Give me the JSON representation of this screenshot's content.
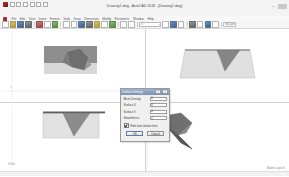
{
  "window": {
    "title": "Drawing1.dwg - AutoCAD 2018 - [Drawing1.dwg]",
    "minimize": "—",
    "maximize": "❐",
    "close": "✕"
  },
  "menubar": {
    "items": [
      "File",
      "Edit",
      "View",
      "Insert",
      "Format",
      "Tools",
      "Draw",
      "Dimension",
      "Modify",
      "Parametric",
      "Window",
      "Help"
    ]
  },
  "toolbar": {
    "layer_combo": "0",
    "color_combo": "ByLayer",
    "linetype_field": "ByLayer",
    "icons": [
      "new-icon",
      "open-icon",
      "save-icon",
      "plot-icon",
      "undo-icon",
      "redo-icon",
      "cut-icon",
      "copy-icon",
      "paste-icon",
      "match-properties-icon",
      "zoom-icon",
      "pan-icon",
      "layer-icon",
      "properties-icon",
      "insert-block-icon",
      "erase-icon"
    ]
  },
  "viewports": {
    "top_left": {
      "name": "Top",
      "ucs_label": "Y\nX"
    },
    "top_right": {
      "name": "Front"
    },
    "bottom_left": {
      "name": "Right"
    },
    "bottom_right": {
      "name": "SE Isometric",
      "note": "Model  Layout1"
    }
  },
  "dialog": {
    "title": "Surface Settings",
    "help_btn": "?",
    "close_btn": "✕",
    "fields": [
      {
        "label": "Mesh Density",
        "value": "6"
      },
      {
        "label": "Surface U",
        "value": "6"
      },
      {
        "label": "Surface V",
        "value": "6"
      },
      {
        "label": "Smoothness",
        "value": "1"
      }
    ],
    "checkbox": {
      "label": "Hide lines below front",
      "checked": true
    },
    "buttons": {
      "ok": "OK",
      "cancel": "Cancel"
    }
  },
  "statusbar": {
    "coords": "",
    "right_note": "MODEL"
  }
}
